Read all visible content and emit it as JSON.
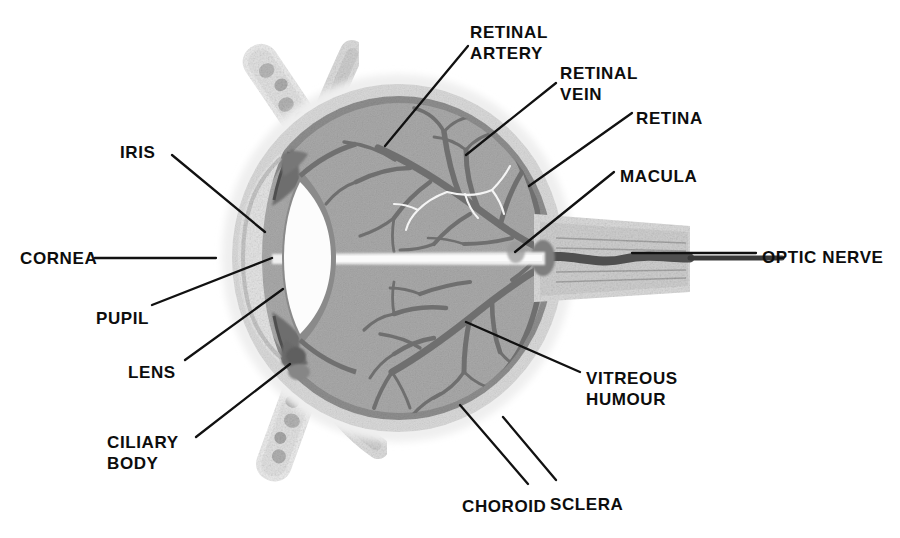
{
  "figure": {
    "type": "anatomical-diagram",
    "background_color": "#ffffff",
    "text_color": "#0d0d0d"
  },
  "palette": {
    "vitreous_gray": "#a9a9a9",
    "choroid_gray": "#8d8d8d",
    "sclera_light": "#d9d9d9",
    "outer_halo": "#ececec",
    "vessel_dark": "#6e6e6e",
    "vessel_light": "#f2f2f2",
    "lens_white": "#fdfdfd",
    "lens_rim": "#8a8a8a",
    "iris_dark": "#6a6a6a",
    "muscle_pale": "#e4e4e4",
    "muscle_speck": "#b4b4b4",
    "nerve_band": "#d2d2d2",
    "nerve_core": "#5a5a5a",
    "leader_line": "#111111"
  },
  "labels": [
    {
      "id": "retinal-artery",
      "text_lines": [
        "RETINAL",
        "ARTERY"
      ],
      "x": 470,
      "y": 22,
      "align": "left"
    },
    {
      "id": "retinal-vein",
      "text_lines": [
        "RETINAL",
        "VEIN"
      ],
      "x": 560,
      "y": 63,
      "align": "left"
    },
    {
      "id": "retina",
      "text_lines": [
        "RETINA"
      ],
      "x": 636,
      "y": 108,
      "align": "left"
    },
    {
      "id": "macula",
      "text_lines": [
        "MACULA"
      ],
      "x": 620,
      "y": 166,
      "align": "left"
    },
    {
      "id": "optic-nerve",
      "text_lines": [
        "OPTIC NERVE"
      ],
      "x": 762,
      "y": 247,
      "align": "left"
    },
    {
      "id": "vitreous-humour",
      "text_lines": [
        "VITREOUS",
        "HUMOUR"
      ],
      "x": 586,
      "y": 368,
      "align": "left"
    },
    {
      "id": "sclera",
      "text_lines": [
        "SCLERA"
      ],
      "x": 550,
      "y": 494,
      "align": "left"
    },
    {
      "id": "choroid",
      "text_lines": [
        "CHOROID"
      ],
      "x": 462,
      "y": 496,
      "align": "left"
    },
    {
      "id": "ciliary-body",
      "text_lines": [
        "CILIARY",
        "BODY"
      ],
      "x": 107,
      "y": 432,
      "align": "left"
    },
    {
      "id": "lens",
      "text_lines": [
        "LENS"
      ],
      "x": 128,
      "y": 362,
      "align": "left"
    },
    {
      "id": "pupil",
      "text_lines": [
        "PUPIL"
      ],
      "x": 96,
      "y": 308,
      "align": "left"
    },
    {
      "id": "cornea",
      "text_lines": [
        "CORNEA"
      ],
      "x": 20,
      "y": 248,
      "align": "left"
    },
    {
      "id": "iris",
      "text_lines": [
        "IRIS"
      ],
      "x": 120,
      "y": 142,
      "align": "left"
    }
  ],
  "leader_lines": [
    {
      "id": "leader-retinal-artery",
      "points": "468,46 385,146"
    },
    {
      "id": "leader-retinal-vein",
      "points": "556,83 466,155"
    },
    {
      "id": "leader-retina",
      "points": "632,113 529,186"
    },
    {
      "id": "leader-macula",
      "points": "614,172 515,252"
    },
    {
      "id": "leader-optic-nerve",
      "points": "756,253 632,253"
    },
    {
      "id": "leader-vitreous-humour",
      "points": "580,372 466,322"
    },
    {
      "id": "leader-sclera",
      "points": "556,480 503,417"
    },
    {
      "id": "leader-choroid",
      "points": "528,484 460,405"
    },
    {
      "id": "leader-ciliary-body",
      "points": "196,437 290,364"
    },
    {
      "id": "leader-lens",
      "points": "185,360 283,289"
    },
    {
      "id": "leader-pupil",
      "points": "152,305 272,258"
    },
    {
      "id": "leader-cornea",
      "points": "95,258 216,258"
    },
    {
      "id": "leader-iris",
      "points": "172,155 265,232"
    }
  ],
  "structures": [
    {
      "id": "eye-globe",
      "name": "eye-globe"
    },
    {
      "id": "sclera-ring",
      "name": "sclera-layer"
    },
    {
      "id": "choroid-ring",
      "name": "choroid-layer"
    },
    {
      "id": "vitreous-body",
      "name": "vitreous-humour-body"
    },
    {
      "id": "cornea-dome",
      "name": "cornea"
    },
    {
      "id": "lens-body",
      "name": "lens"
    },
    {
      "id": "iris-upper",
      "name": "iris-upper-leaf"
    },
    {
      "id": "iris-lower",
      "name": "iris-lower-leaf"
    },
    {
      "id": "optic-nerve-band",
      "name": "optic-nerve"
    },
    {
      "id": "optic-disc",
      "name": "optic-disc"
    },
    {
      "id": "macula-spot",
      "name": "macula"
    },
    {
      "id": "muscle-superior",
      "name": "superior-rectus-muscle"
    },
    {
      "id": "muscle-superior-tendon",
      "name": "superior-rectus-tendon"
    },
    {
      "id": "muscle-inferior",
      "name": "inferior-rectus-muscle"
    },
    {
      "id": "muscle-inferior-tendon",
      "name": "inferior-rectus-tendon"
    },
    {
      "id": "vessels-upper",
      "name": "retinal-vessels-upper"
    },
    {
      "id": "vessels-lower",
      "name": "retinal-vessels-lower"
    },
    {
      "id": "optic-axis-band",
      "name": "optic-axis-band"
    }
  ]
}
